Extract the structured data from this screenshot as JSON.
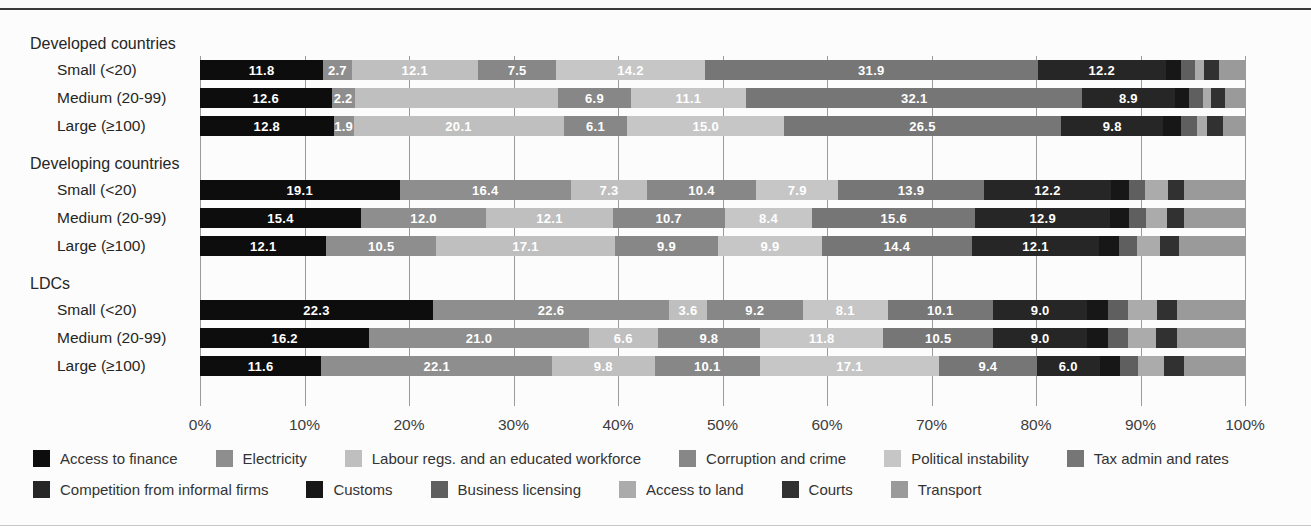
{
  "page": {
    "background": "#fcfcfc",
    "top_rule_color": "#3a3a3a",
    "bottom_rule_color": "#c8c8c8"
  },
  "chart_data": {
    "type": "bar",
    "subtype": "horizontal-stacked-100pct",
    "unit": "%",
    "xlim": [
      0,
      100
    ],
    "grid": true,
    "legend_position": "bottom",
    "x_ticks": [
      "0%",
      "10%",
      "20%",
      "30%",
      "40%",
      "50%",
      "60%",
      "70%",
      "80%",
      "90%",
      "100%"
    ],
    "series": [
      {
        "name": "Access to finance",
        "color": "#0d0d0d"
      },
      {
        "name": "Electricity",
        "color": "#8e8e8e"
      },
      {
        "name": "Labour regs. and an educated workforce",
        "color": "#bfbfbf"
      },
      {
        "name": "Corruption and crime",
        "color": "#878787"
      },
      {
        "name": "Political instability",
        "color": "#c6c6c6"
      },
      {
        "name": "Tax admin and rates",
        "color": "#767676"
      },
      {
        "name": "Competition from informal firms",
        "color": "#262626"
      },
      {
        "name": "Customs",
        "color": "#171717"
      },
      {
        "name": "Business licensing",
        "color": "#5f5f5f"
      },
      {
        "name": "Access to land",
        "color": "#ababab"
      },
      {
        "name": "Courts",
        "color": "#313131"
      },
      {
        "name": "Transport",
        "color": "#9a9a9a"
      }
    ],
    "groups": [
      {
        "label": "Developed countries",
        "rows": [
          {
            "label": "Small (<20)",
            "values": [
              11.8,
              2.7,
              12.1,
              7.5,
              14.2,
              31.9,
              12.2,
              1.5,
              1.3,
              0.9,
              1.4,
              2.5
            ],
            "display": [
              "11.8",
              "2.7",
              "12.1",
              "7.5",
              "14.2",
              "31.9",
              "12.2",
              "",
              "",
              "",
              "",
              ""
            ]
          },
          {
            "label": "Medium (20-99)",
            "values": [
              12.6,
              2.2,
              19.5,
              6.9,
              11.1,
              32.1,
              8.9,
              1.3,
              1.4,
              0.8,
              1.3,
              1.9
            ],
            "display": [
              "12.6",
              "2.2",
              "",
              "6.9",
              "11.1",
              "32.1",
              "8.9",
              "",
              "",
              "",
              "",
              ""
            ]
          },
          {
            "label": "Large (≥100)",
            "values": [
              12.8,
              1.9,
              20.1,
              6.1,
              15.0,
              26.5,
              9.8,
              1.7,
              1.5,
              1.0,
              1.5,
              2.1
            ],
            "display": [
              "12.8",
              "1.9",
              "20.1",
              "6.1",
              "15.0",
              "26.5",
              "9.8",
              "",
              "",
              "",
              "",
              ""
            ]
          }
        ]
      },
      {
        "label": "Developing countries",
        "rows": [
          {
            "label": "Small (<20)",
            "values": [
              19.1,
              16.4,
              7.3,
              10.4,
              7.9,
              13.9,
              12.2,
              1.7,
              1.5,
              2.2,
              1.6,
              5.8
            ],
            "display": [
              "19.1",
              "16.4",
              "7.3",
              "10.4",
              "7.9",
              "13.9",
              "12.2",
              "",
              "",
              "",
              "",
              ""
            ]
          },
          {
            "label": "Medium (20-99)",
            "values": [
              15.4,
              12.0,
              12.1,
              10.7,
              8.4,
              15.6,
              12.9,
              1.8,
              1.6,
              2.0,
              1.7,
              5.8
            ],
            "display": [
              "15.4",
              "12.0",
              "12.1",
              "10.7",
              "8.4",
              "15.6",
              "12.9",
              "",
              "",
              "",
              "",
              ""
            ]
          },
          {
            "label": "Large (≥100)",
            "values": [
              12.1,
              10.5,
              17.1,
              9.9,
              9.9,
              14.4,
              12.1,
              1.9,
              1.8,
              2.2,
              1.8,
              6.3
            ],
            "display": [
              "12.1",
              "10.5",
              "17.1",
              "9.9",
              "9.9",
              "14.4",
              "12.1",
              "",
              "",
              "",
              "",
              ""
            ]
          }
        ]
      },
      {
        "label": "LDCs",
        "rows": [
          {
            "label": "Small (<20)",
            "values": [
              22.3,
              22.6,
              3.6,
              9.2,
              8.1,
              10.1,
              9.0,
              2.0,
              1.9,
              2.8,
              1.9,
              6.5
            ],
            "display": [
              "22.3",
              "22.6",
              "3.6",
              "9.2",
              "8.1",
              "10.1",
              "9.0",
              "",
              "",
              "",
              "",
              ""
            ]
          },
          {
            "label": "Medium (20-99)",
            "values": [
              16.2,
              21.0,
              6.6,
              9.8,
              11.8,
              10.5,
              9.0,
              2.0,
              1.9,
              2.7,
              2.0,
              6.5
            ],
            "display": [
              "16.2",
              "21.0",
              "6.6",
              "9.8",
              "11.8",
              "10.5",
              "9.0",
              "",
              "",
              "",
              "",
              ""
            ]
          },
          {
            "label": "Large (≥100)",
            "values": [
              11.6,
              22.1,
              9.8,
              10.1,
              17.1,
              9.4,
              6.0,
              1.9,
              1.8,
              2.5,
              1.9,
              5.8
            ],
            "display": [
              "11.6",
              "22.1",
              "9.8",
              "10.1",
              "17.1",
              "9.4",
              "6.0",
              "",
              "",
              "",
              "",
              ""
            ]
          }
        ]
      }
    ]
  }
}
